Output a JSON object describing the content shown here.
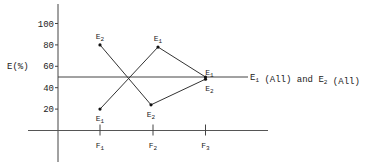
{
  "chart_data": {
    "type": "line",
    "title": "",
    "xlabel": "",
    "ylabel": "E(%)",
    "ylim": [
      0,
      100
    ],
    "yticks": [
      20,
      40,
      60,
      80,
      100
    ],
    "categories": [
      {
        "base": "F",
        "sub": "1"
      },
      {
        "base": "F",
        "sub": "2"
      },
      {
        "base": "F",
        "sub": "3"
      }
    ],
    "series": [
      {
        "name": "E1",
        "base": "E",
        "sub": "1",
        "values": [
          20,
          78,
          50
        ],
        "label_pos": [
          "below",
          "above",
          "above"
        ]
      },
      {
        "name": "E2",
        "base": "E",
        "sub": "2",
        "values": [
          80,
          24,
          48
        ],
        "label_pos": [
          "above",
          "below",
          "below"
        ]
      }
    ],
    "reference_line": {
      "value": 50,
      "label_parts": [
        {
          "base": "E",
          "sub": "1"
        },
        {
          "text": " (All) and "
        },
        {
          "base": "E",
          "sub": "2"
        },
        {
          "text": " (All)"
        }
      ]
    },
    "grid": false,
    "legend": "none",
    "colors": {
      "line": "#333333",
      "axis": "#444444",
      "text": "#222222"
    }
  }
}
